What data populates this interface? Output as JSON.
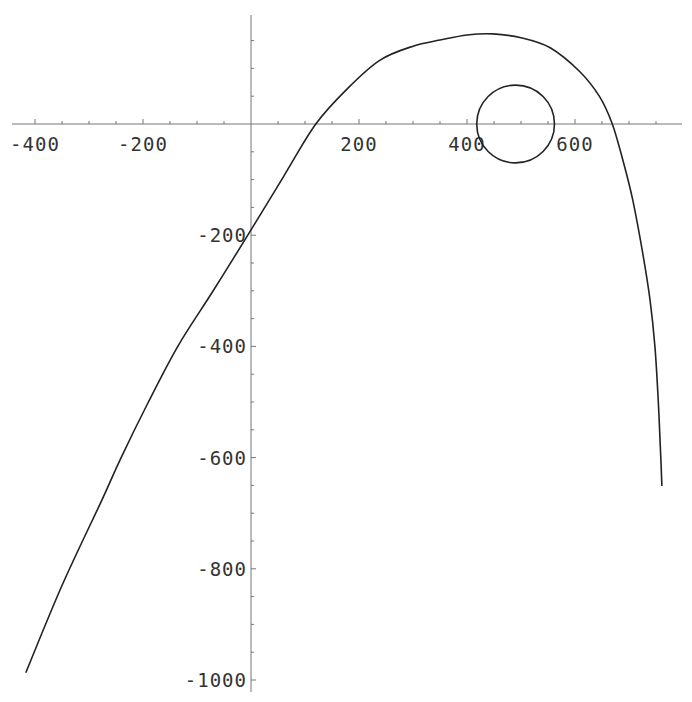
{
  "chart_data": {
    "type": "line",
    "title": "",
    "xlabel": "",
    "ylabel": "",
    "xlim": [
      -460,
      800
    ],
    "ylim": [
      -1020,
      195
    ],
    "grid": false,
    "legend": null,
    "x_ticks": [
      -400,
      -200,
      200,
      400,
      600
    ],
    "x_tick_labels": [
      "-400",
      "-200",
      "200",
      "400",
      "600"
    ],
    "y_ticks": [
      -200,
      -400,
      -600,
      -800,
      -1000
    ],
    "y_tick_labels": [
      "-200",
      "-400",
      "-600",
      "-800",
      "-1000"
    ],
    "series": [
      {
        "name": "curve",
        "kind": "parametric-line",
        "points": [
          [
            -417,
            -987
          ],
          [
            -350,
            -830
          ],
          [
            -276,
            -676
          ],
          [
            -241,
            -601
          ],
          [
            -190,
            -500
          ],
          [
            -135,
            -399
          ],
          [
            -70,
            -300
          ],
          [
            -6,
            -200
          ],
          [
            60,
            -95
          ],
          [
            120,
            0
          ],
          [
            180,
            65
          ],
          [
            239,
            115
          ],
          [
            300,
            140
          ],
          [
            350,
            151
          ],
          [
            400,
            160
          ],
          [
            448,
            162
          ],
          [
            500,
            155
          ],
          [
            554,
            137
          ],
          [
            609,
            94
          ],
          [
            645,
            50
          ],
          [
            669,
            0
          ],
          [
            690,
            -70
          ],
          [
            707,
            -137
          ],
          [
            725,
            -230
          ],
          [
            739,
            -317
          ],
          [
            748,
            -400
          ],
          [
            754,
            -496
          ],
          [
            758,
            -580
          ],
          [
            761,
            -651
          ]
        ]
      },
      {
        "name": "circle",
        "kind": "circle",
        "center": [
          490,
          0
        ],
        "radius": 72
      }
    ],
    "axes_origin": [
      0,
      0
    ]
  },
  "colors": {
    "curve": "#222222",
    "axis": "#777777",
    "label": "#333333",
    "background": "#ffffff"
  }
}
